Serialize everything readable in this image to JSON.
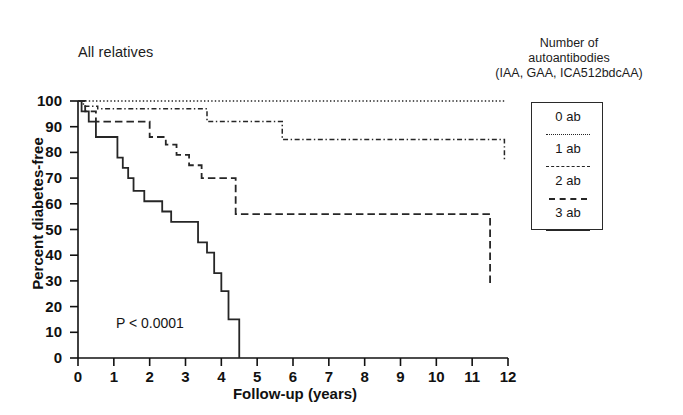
{
  "panel": {
    "title": "All relatives",
    "pvalue": "P < 0.0001"
  },
  "legend": {
    "header_lines": [
      "Number of",
      "autoantibodies",
      "(IAA, GAA, ICA512bdcAA)"
    ],
    "entries": [
      {
        "label": "0 ab",
        "style": "dotted"
      },
      {
        "label": "1 ab",
        "style": "dash-dot"
      },
      {
        "label": "2 ab",
        "style": "dashed"
      },
      {
        "label": "3 ab",
        "style": "solid"
      }
    ]
  },
  "chart_data": {
    "type": "line",
    "title": "All relatives",
    "xlabel": "Follow-up (years)",
    "ylabel": "Percent diabetes-free",
    "xlim": [
      0,
      12
    ],
    "ylim": [
      0,
      100
    ],
    "xticks": [
      0,
      1,
      2,
      3,
      4,
      5,
      6,
      7,
      8,
      9,
      10,
      11,
      12
    ],
    "yticks": [
      0,
      10,
      20,
      30,
      40,
      50,
      60,
      70,
      80,
      90,
      100
    ],
    "grid": false,
    "legend_position": "right",
    "annotations": [
      "P < 0.0001"
    ],
    "step": "post",
    "series": [
      {
        "name": "0 ab",
        "style": "dotted",
        "color": "#262626",
        "x": [
          0,
          11.9
        ],
        "y": [
          100,
          100
        ]
      },
      {
        "name": "1 ab",
        "style": "dash-dot",
        "color": "#262626",
        "x": [
          0,
          0.15,
          0.55,
          1.7,
          3.6,
          5.7,
          11.9
        ],
        "y": [
          100,
          98,
          97,
          97,
          92,
          85,
          77
        ]
      },
      {
        "name": "2 ab",
        "style": "dashed",
        "color": "#262626",
        "x": [
          0,
          0.2,
          0.5,
          1.25,
          2.0,
          2.45,
          2.75,
          3.1,
          3.45,
          3.8,
          4.4,
          9.7,
          11.5
        ],
        "y": [
          100,
          96,
          92,
          92,
          86,
          83,
          79,
          75,
          70,
          70,
          56,
          56,
          28
        ]
      },
      {
        "name": "3 ab",
        "style": "solid",
        "color": "#262626",
        "x": [
          0,
          0.1,
          0.3,
          0.5,
          0.9,
          1.1,
          1.25,
          1.4,
          1.55,
          1.7,
          1.85,
          2.1,
          2.35,
          2.6,
          2.85,
          3.1,
          3.35,
          3.6,
          3.8,
          4.0,
          4.2,
          4.5
        ],
        "y": [
          100,
          96,
          92,
          86,
          86,
          78,
          74,
          70,
          65,
          65,
          61,
          61,
          57,
          53,
          53,
          53,
          45,
          41,
          33,
          26,
          15,
          0
        ]
      }
    ]
  },
  "axes": {
    "x_title": "Follow-up (years)",
    "y_title": "Percent diabetes-free",
    "x_tick_labels": [
      "0",
      "1",
      "2",
      "3",
      "4",
      "5",
      "6",
      "7",
      "8",
      "9",
      "10",
      "11",
      "12"
    ],
    "y_tick_labels": [
      "0",
      "10",
      "20",
      "30",
      "40",
      "50",
      "60",
      "70",
      "80",
      "90",
      "100"
    ]
  }
}
